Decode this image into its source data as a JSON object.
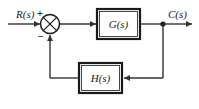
{
  "diagram": {
    "type": "control-system-block-diagram",
    "background_color": "#ffffff",
    "line_color": "#333333",
    "labels": {
      "input": "R(s)",
      "output": "C(s)",
      "forward_block": "G(s)",
      "feedback_block": "H(s)",
      "sum_positive": "+",
      "sum_negative": "−"
    },
    "nodes": [
      {
        "name": "input-signal",
        "label": "R(s)"
      },
      {
        "name": "summing-junction",
        "label": "⊗"
      },
      {
        "name": "forward-transfer-block",
        "label": "G(s)"
      },
      {
        "name": "output-signal",
        "label": "C(s)"
      },
      {
        "name": "feedback-transfer-block",
        "label": "H(s)"
      }
    ],
    "connections": [
      {
        "from": "R(s)",
        "to": "summing-junction",
        "arrow": true
      },
      {
        "from": "summing-junction",
        "to": "G(s)",
        "arrow": true
      },
      {
        "from": "G(s)",
        "to": "C(s)",
        "arrow": true
      },
      {
        "from": "C(s)",
        "to": "H(s)",
        "arrow": true
      },
      {
        "from": "H(s)",
        "to": "summing-junction",
        "arrow": true
      }
    ]
  }
}
